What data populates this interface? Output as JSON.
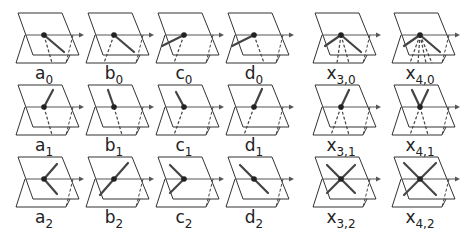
{
  "colors": {
    "plane": "#333333",
    "axis": "#555555",
    "stick": "#444444",
    "dashed": "#444444",
    "dot": "#222222"
  },
  "columns_x": [
    18,
    88,
    158,
    228,
    315,
    394
  ],
  "rows_y": [
    13,
    85,
    157
  ],
  "panels": [
    {
      "id": "a0",
      "base": "a",
      "sub": "0",
      "col": 0,
      "row": 0,
      "solid": [
        [
          20,
          17
        ]
      ],
      "dashed": [
        [
          8,
          28
        ]
      ]
    },
    {
      "id": "b0",
      "base": "b",
      "sub": "0",
      "col": 1,
      "row": 0,
      "solid": [
        [
          20,
          17
        ]
      ],
      "dashed": [
        [
          -10,
          28
        ]
      ]
    },
    {
      "id": "c0",
      "base": "c",
      "sub": "0",
      "col": 2,
      "row": 0,
      "solid": [
        [
          -22,
          11
        ]
      ],
      "dashed": [
        [
          -10,
          28
        ]
      ]
    },
    {
      "id": "d0",
      "base": "d",
      "sub": "0",
      "col": 3,
      "row": 0,
      "solid": [
        [
          -22,
          11
        ]
      ],
      "dashed": [
        [
          10,
          28
        ]
      ]
    },
    {
      "id": "x30",
      "base": "x",
      "sub": "3,0",
      "col": 4,
      "row": 0,
      "solid": [
        [
          -16,
          11
        ],
        [
          20,
          17
        ]
      ],
      "dashed": [
        [
          -4,
          28
        ],
        [
          8,
          28
        ]
      ]
    },
    {
      "id": "x40",
      "base": "x",
      "sub": "4,0",
      "col": 5,
      "row": 0,
      "solid": [
        [
          -16,
          11
        ],
        [
          20,
          17
        ]
      ],
      "dashed": [
        [
          -10,
          28
        ],
        [
          -2,
          28
        ],
        [
          6,
          28
        ],
        [
          12,
          28
        ]
      ]
    },
    {
      "id": "a1",
      "base": "a",
      "sub": "1",
      "col": 0,
      "row": 1,
      "solid": [
        [
          9,
          -17
        ]
      ],
      "dashed": [
        [
          8,
          28
        ]
      ]
    },
    {
      "id": "b1",
      "base": "b",
      "sub": "1",
      "col": 1,
      "row": 1,
      "solid": [
        [
          -6,
          -17
        ]
      ],
      "dashed": [
        [
          8,
          28
        ]
      ]
    },
    {
      "id": "c1",
      "base": "c",
      "sub": "1",
      "col": 2,
      "row": 1,
      "solid": [
        [
          -8,
          -15
        ]
      ],
      "dashed": [
        [
          -10,
          28
        ]
      ]
    },
    {
      "id": "d1",
      "base": "d",
      "sub": "1",
      "col": 3,
      "row": 1,
      "solid": [
        [
          8,
          -18
        ]
      ],
      "dashed": [
        [
          -10,
          28
        ]
      ]
    },
    {
      "id": "x31",
      "base": "x",
      "sub": "3,1",
      "col": 4,
      "row": 1,
      "solid": [
        [
          8,
          -17
        ]
      ],
      "dashed": [
        [
          -10,
          28
        ],
        [
          8,
          28
        ]
      ]
    },
    {
      "id": "x41",
      "base": "x",
      "sub": "4,1",
      "col": 5,
      "row": 1,
      "solid": [
        [
          -8,
          -17
        ],
        [
          8,
          -17
        ]
      ],
      "dashed": [
        [
          -10,
          28
        ],
        [
          8,
          28
        ]
      ]
    },
    {
      "id": "a2",
      "base": "a",
      "sub": "2",
      "col": 0,
      "row": 2,
      "solid": [
        [
          13,
          -15
        ],
        [
          13,
          15
        ]
      ],
      "dashed": []
    },
    {
      "id": "b2",
      "base": "b",
      "sub": "2",
      "col": 1,
      "row": 2,
      "solid": [
        [
          14,
          -16
        ],
        [
          -14,
          16
        ]
      ],
      "dashed": []
    },
    {
      "id": "c2",
      "base": "c",
      "sub": "2",
      "col": 2,
      "row": 2,
      "solid": [
        [
          -14,
          -14
        ],
        [
          -14,
          14
        ]
      ],
      "dashed": []
    },
    {
      "id": "d2",
      "base": "d",
      "sub": "2",
      "col": 3,
      "row": 2,
      "solid": [
        [
          -14,
          -14
        ],
        [
          14,
          14
        ]
      ],
      "dashed": []
    },
    {
      "id": "x32",
      "base": "x",
      "sub": "3,2",
      "col": 4,
      "row": 2,
      "solid": [
        [
          -14,
          -14
        ],
        [
          14,
          -14
        ],
        [
          -14,
          14
        ],
        [
          14,
          14
        ]
      ],
      "dashed": []
    },
    {
      "id": "x42",
      "base": "x",
      "sub": "4,2",
      "col": 5,
      "row": 2,
      "solid": [
        [
          -16,
          -16
        ],
        [
          16,
          -16
        ],
        [
          -16,
          16
        ],
        [
          16,
          16
        ]
      ],
      "dashed": []
    }
  ]
}
